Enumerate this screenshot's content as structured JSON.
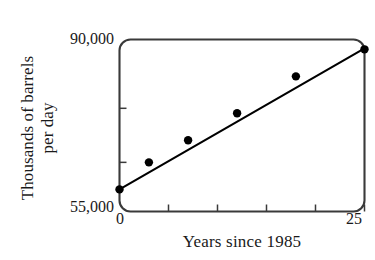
{
  "chart_data": {
    "type": "scatter",
    "title": "",
    "xlabel": "Years since 1985",
    "ylabel_line1": "Thousands of barrels",
    "ylabel_line2": "per day",
    "xlim": [
      0,
      25
    ],
    "ylim": [
      55000,
      90000
    ],
    "x_tick_labels": [
      "0",
      "25"
    ],
    "y_tick_labels": [
      "90,000",
      "55,000"
    ],
    "x_minor_ticks": [
      5,
      10,
      15,
      20,
      25
    ],
    "y_minor_ticks": [
      65000,
      76000
    ],
    "grid": false,
    "legend": null,
    "x": [
      0,
      3,
      7,
      12,
      18,
      25
    ],
    "values": [
      59500,
      65000,
      69500,
      75000,
      82500,
      88000
    ],
    "series": [
      {
        "name": "Oil production",
        "x": [
          0,
          3,
          7,
          12,
          18,
          25
        ],
        "values": [
          59500,
          65000,
          69500,
          75000,
          82500,
          88000
        ],
        "marker": "filled-circle",
        "color": "#000000"
      }
    ],
    "trendline": {
      "name": "line of best fit",
      "x": [
        0,
        25
      ],
      "values": [
        59500,
        88200
      ],
      "color": "#000000"
    },
    "colors": {
      "ink": "#1a1a1a",
      "frame": "#3a3a3a",
      "marker": "#000000",
      "line": "#000000",
      "background": "#ffffff"
    }
  }
}
